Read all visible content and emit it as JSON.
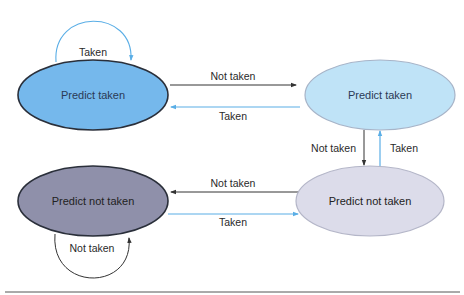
{
  "diagram": {
    "type": "state-machine",
    "colors": {
      "strong_taken_fill": "#75b8ec",
      "weak_taken_fill": "#bfe3f7",
      "strong_not_taken_fill": "#8f90aa",
      "weak_not_taken_fill": "#dcdcea",
      "taken_arrow": "#5aaee6",
      "not_taken_arrow": "#333333"
    },
    "states": [
      {
        "id": "s0",
        "label": "Predict taken"
      },
      {
        "id": "s1",
        "label": "Predict taken"
      },
      {
        "id": "s2",
        "label": "Predict not taken"
      },
      {
        "id": "s3",
        "label": "Predict not taken"
      }
    ],
    "transitions": [
      {
        "from": "s0",
        "to": "s0",
        "label": "Taken"
      },
      {
        "from": "s0",
        "to": "s1",
        "label": "Not taken"
      },
      {
        "from": "s1",
        "to": "s0",
        "label": "Taken"
      },
      {
        "from": "s1",
        "to": "s3",
        "label": "Not taken"
      },
      {
        "from": "s3",
        "to": "s1",
        "label": "Taken"
      },
      {
        "from": "s3",
        "to": "s2",
        "label": "Not taken"
      },
      {
        "from": "s2",
        "to": "s3",
        "label": "Taken"
      },
      {
        "from": "s2",
        "to": "s2",
        "label": "Not taken"
      }
    ]
  }
}
